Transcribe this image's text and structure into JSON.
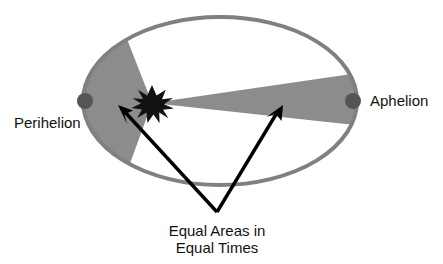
{
  "figure": {
    "type": "diagram",
    "background_color": "#ffffff"
  },
  "labels": {
    "perihelion": "Perihelion",
    "aphelion": "Aphelion",
    "caption_line1": "Equal Areas in",
    "caption_line2": "Equal Times"
  },
  "icons": {
    "sun": "sun-star-icon",
    "perihelion_point": "orbit-point-icon",
    "aphelion_point": "orbit-point-icon",
    "left_arrow": "arrow-pointer-icon",
    "right_arrow": "arrow-pointer-icon"
  },
  "colors": {
    "orbit_stroke": "#808080",
    "sector_fill": "#8c8c8c",
    "planet_dot": "#555555",
    "sun_fill": "#121212",
    "arrow_stroke": "#000000",
    "text": "#111111"
  },
  "geometry": {
    "ellipse": {
      "cx": 220,
      "cy": 101,
      "rx": 137,
      "ry": 84,
      "stroke_width": 4
    },
    "sun": {
      "cx": 152,
      "cy": 103,
      "outer_r": 15,
      "inner_r": 7,
      "spikes": 11
    },
    "perihelion_dot": {
      "cx": 85,
      "cy": 101,
      "r": 8
    },
    "aphelion_dot": {
      "cx": 353,
      "cy": 101,
      "r": 8
    },
    "left_sector": {
      "start_angle_deg": 152,
      "end_angle_deg": 208
    },
    "right_sector": {
      "start_angle_deg": -12,
      "end_angle_deg": 9
    },
    "left_arrow": {
      "tail_x": 217,
      "tail_y": 212,
      "tip_x": 120,
      "tip_y": 108
    },
    "right_arrow": {
      "tail_x": 217,
      "tail_y": 212,
      "tip_x": 281,
      "tip_y": 108
    }
  },
  "text_positions": {
    "perihelion": {
      "x": 14,
      "y": 128
    },
    "aphelion": {
      "x": 370,
      "y": 106
    },
    "caption_line1": {
      "x": 217,
      "y": 236
    },
    "caption_line2": {
      "x": 217,
      "y": 253
    }
  }
}
